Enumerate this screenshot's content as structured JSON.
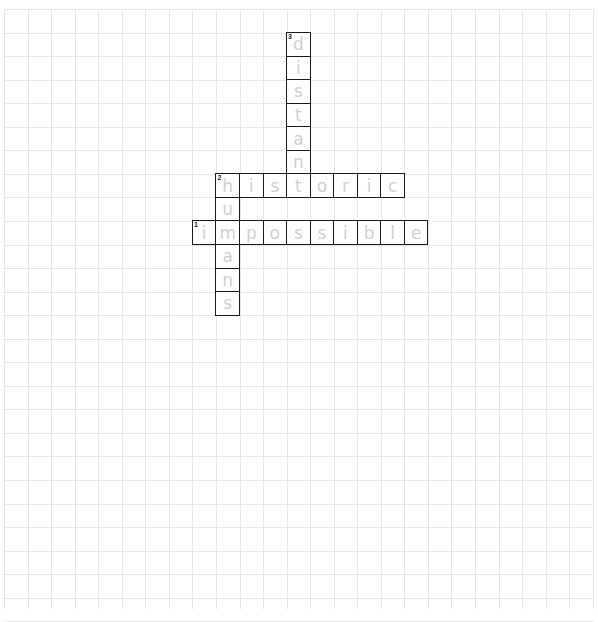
{
  "puzzle": {
    "grid": {
      "cols": 25,
      "rows": 26,
      "cell_size": 23.55,
      "origin_x": 4,
      "origin_y": 9,
      "line_color": "#e6e6e6",
      "border_color": "#1a1a1a",
      "letter_color": "#cfcfcf"
    },
    "entries": [
      {
        "number": "1",
        "direction": "across",
        "answer": "impossible",
        "row": 9,
        "col": 8
      },
      {
        "number": "2",
        "direction": "across",
        "answer": "historic",
        "row": 7,
        "col": 9
      },
      {
        "number": "2",
        "direction": "down",
        "answer": "humans",
        "row": 7,
        "col": 9
      },
      {
        "number": "3",
        "direction": "down",
        "answer": "distant",
        "row": 1,
        "col": 12
      }
    ]
  }
}
